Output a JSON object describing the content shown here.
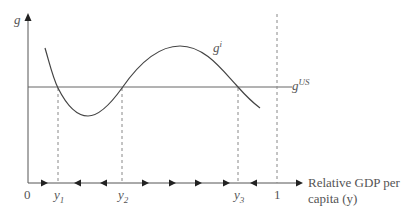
{
  "diagram": {
    "y_axis_label": "g",
    "x_axis_label_line1": "Relative GDP per",
    "x_axis_label_line2": "capita (y)",
    "origin_label": "0",
    "curve_label": "g",
    "curve_label_sup": "i",
    "reference_line_label": "g",
    "reference_line_label_sup": "US",
    "equilibria": [
      {
        "label": "y",
        "sub": "1"
      },
      {
        "label": "y",
        "sub": "2"
      },
      {
        "label": "y",
        "sub": "3"
      }
    ],
    "unity_label": "1",
    "arrow_directions": [
      "right",
      "left",
      "left",
      "right",
      "right",
      "right",
      "right",
      "left",
      "right"
    ]
  },
  "colors": {
    "axis": "#555555",
    "curve": "#444444",
    "dashed": "#888888"
  }
}
